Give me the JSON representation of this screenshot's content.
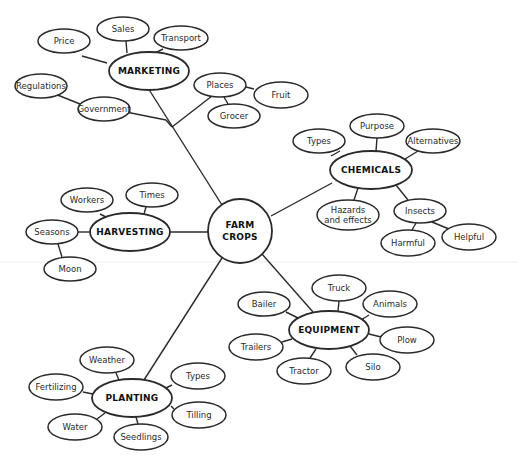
{
  "diagram": {
    "center": {
      "id": "farm-crops",
      "lines": [
        "FARM",
        "CROPS"
      ],
      "cx": 240,
      "cy": 231,
      "r": 32
    },
    "hubs": [
      {
        "id": "marketing",
        "label": "MARKETING",
        "cx": 149,
        "cy": 71,
        "rx": 40,
        "ry": 19
      },
      {
        "id": "chemicals",
        "label": "CHEMICALS",
        "cx": 371,
        "cy": 170,
        "rx": 41,
        "ry": 19
      },
      {
        "id": "harvesting",
        "label": "HARVESTING",
        "cx": 130,
        "cy": 232,
        "rx": 40,
        "ry": 19
      },
      {
        "id": "equipment",
        "label": "EQUIPMENT",
        "cx": 329,
        "cy": 330,
        "rx": 40,
        "ry": 19
      },
      {
        "id": "planting",
        "label": "PLANTING",
        "cx": 132,
        "cy": 398,
        "rx": 40,
        "ry": 19
      }
    ],
    "leaves": [
      {
        "id": "price",
        "label": "Price",
        "cx": 64,
        "cy": 41,
        "rx": 26,
        "ry": 12
      },
      {
        "id": "sales",
        "label": "Sales",
        "cx": 123,
        "cy": 29,
        "rx": 26,
        "ry": 12
      },
      {
        "id": "transport",
        "label": "Transport",
        "cx": 181,
        "cy": 38,
        "rx": 27,
        "ry": 12
      },
      {
        "id": "regulations",
        "label": "Regulations",
        "cx": 41,
        "cy": 86,
        "rx": 26,
        "ry": 12
      },
      {
        "id": "government",
        "label": "Government",
        "cx": 104,
        "cy": 109,
        "rx": 26,
        "ry": 12
      },
      {
        "id": "places",
        "label": "Places",
        "cx": 220,
        "cy": 85,
        "rx": 26,
        "ry": 12
      },
      {
        "id": "fruit",
        "label": "Fruit",
        "cx": 281,
        "cy": 95,
        "rx": 27,
        "ry": 13
      },
      {
        "id": "grocer",
        "label": "Grocer",
        "cx": 234,
        "cy": 116,
        "rx": 26,
        "ry": 12
      },
      {
        "id": "chem-types",
        "label": "Types",
        "cx": 319,
        "cy": 141,
        "rx": 26,
        "ry": 12
      },
      {
        "id": "purpose",
        "label": "Purpose",
        "cx": 377,
        "cy": 126,
        "rx": 27,
        "ry": 12
      },
      {
        "id": "alternatives",
        "label": "Alternatives",
        "cx": 433,
        "cy": 141,
        "rx": 27,
        "ry": 12
      },
      {
        "id": "hazards",
        "lines": [
          "Hazards",
          "and effects"
        ],
        "cx": 348,
        "cy": 215,
        "rx": 31,
        "ry": 15
      },
      {
        "id": "insects",
        "label": "Insects",
        "cx": 420,
        "cy": 211,
        "rx": 26,
        "ry": 12
      },
      {
        "id": "harmful",
        "label": "Harmful",
        "cx": 408,
        "cy": 243,
        "rx": 27,
        "ry": 13
      },
      {
        "id": "helpful",
        "label": "Helpful",
        "cx": 469,
        "cy": 237,
        "rx": 27,
        "ry": 13
      },
      {
        "id": "workers",
        "label": "Workers",
        "cx": 87,
        "cy": 200,
        "rx": 26,
        "ry": 12
      },
      {
        "id": "times",
        "label": "Times",
        "cx": 152,
        "cy": 195,
        "rx": 26,
        "ry": 12
      },
      {
        "id": "seasons",
        "label": "Seasons",
        "cx": 52,
        "cy": 232,
        "rx": 26,
        "ry": 12
      },
      {
        "id": "moon",
        "label": "Moon",
        "cx": 70,
        "cy": 269,
        "rx": 26,
        "ry": 12
      },
      {
        "id": "truck",
        "label": "Truck",
        "cx": 339,
        "cy": 288,
        "rx": 27,
        "ry": 13
      },
      {
        "id": "animals",
        "label": "Animals",
        "cx": 390,
        "cy": 304,
        "rx": 27,
        "ry": 13
      },
      {
        "id": "bailer",
        "label": "Bailer",
        "cx": 264,
        "cy": 304,
        "rx": 26,
        "ry": 12
      },
      {
        "id": "plow",
        "label": "Plow",
        "cx": 407,
        "cy": 340,
        "rx": 27,
        "ry": 13
      },
      {
        "id": "trailers",
        "label": "Trailers",
        "cx": 256,
        "cy": 347,
        "rx": 27,
        "ry": 13
      },
      {
        "id": "tractor",
        "label": "Tractor",
        "cx": 304,
        "cy": 371,
        "rx": 27,
        "ry": 13
      },
      {
        "id": "silo",
        "label": "Silo",
        "cx": 373,
        "cy": 367,
        "rx": 27,
        "ry": 13
      },
      {
        "id": "weather",
        "label": "Weather",
        "cx": 107,
        "cy": 360,
        "rx": 27,
        "ry": 13
      },
      {
        "id": "plant-types",
        "label": "Types",
        "cx": 198,
        "cy": 376,
        "rx": 27,
        "ry": 13
      },
      {
        "id": "fertilizing",
        "label": "Fertilizing",
        "cx": 56,
        "cy": 387,
        "rx": 27,
        "ry": 13
      },
      {
        "id": "tilling",
        "label": "Tilling",
        "cx": 199,
        "cy": 415,
        "rx": 27,
        "ry": 13
      },
      {
        "id": "water",
        "label": "Water",
        "cx": 75,
        "cy": 427,
        "rx": 27,
        "ry": 13
      },
      {
        "id": "seedlings",
        "label": "Seedlings",
        "cx": 141,
        "cy": 437,
        "rx": 27,
        "ry": 13
      }
    ],
    "edges": [
      [
        148,
        88,
        222,
        205
      ],
      [
        126,
        112,
        166,
        120
      ],
      [
        166,
        120,
        172,
        127
      ],
      [
        172,
        127,
        212,
        96
      ],
      [
        55,
        94,
        80,
        104
      ],
      [
        246,
        87,
        254,
        89
      ],
      [
        224,
        97,
        228,
        104
      ],
      [
        82,
        56,
        107,
        63
      ],
      [
        126,
        41,
        127,
        53
      ],
      [
        163,
        49,
        155,
        53
      ],
      [
        271,
        216,
        332,
        183
      ],
      [
        340,
        151,
        331,
        156
      ],
      [
        377,
        138,
        376,
        151
      ],
      [
        418,
        151,
        405,
        159
      ],
      [
        358,
        188,
        354,
        200
      ],
      [
        396,
        185,
        408,
        200
      ],
      [
        416,
        223,
        412,
        230
      ],
      [
        432,
        222,
        449,
        229
      ],
      [
        208,
        232,
        170,
        232
      ],
      [
        100,
        214,
        110,
        219
      ],
      [
        146,
        207,
        144,
        214
      ],
      [
        78,
        232,
        90,
        232
      ],
      [
        58,
        244,
        62,
        257
      ],
      [
        262,
        254,
        313,
        312
      ],
      [
        222,
        258,
        144,
        380
      ],
      [
        339,
        301,
        338,
        311
      ],
      [
        369,
        315,
        361,
        320
      ],
      [
        286,
        312,
        298,
        318
      ],
      [
        369,
        334,
        381,
        337
      ],
      [
        282,
        342,
        292,
        339
      ],
      [
        316,
        349,
        310,
        358
      ],
      [
        350,
        346,
        357,
        355
      ],
      [
        116,
        373,
        119,
        380
      ],
      [
        172,
        385,
        166,
        388
      ],
      [
        83,
        392,
        93,
        394
      ],
      [
        171,
        406,
        174,
        409
      ],
      [
        97,
        419,
        105,
        413
      ],
      [
        136,
        417,
        138,
        424
      ]
    ]
  }
}
